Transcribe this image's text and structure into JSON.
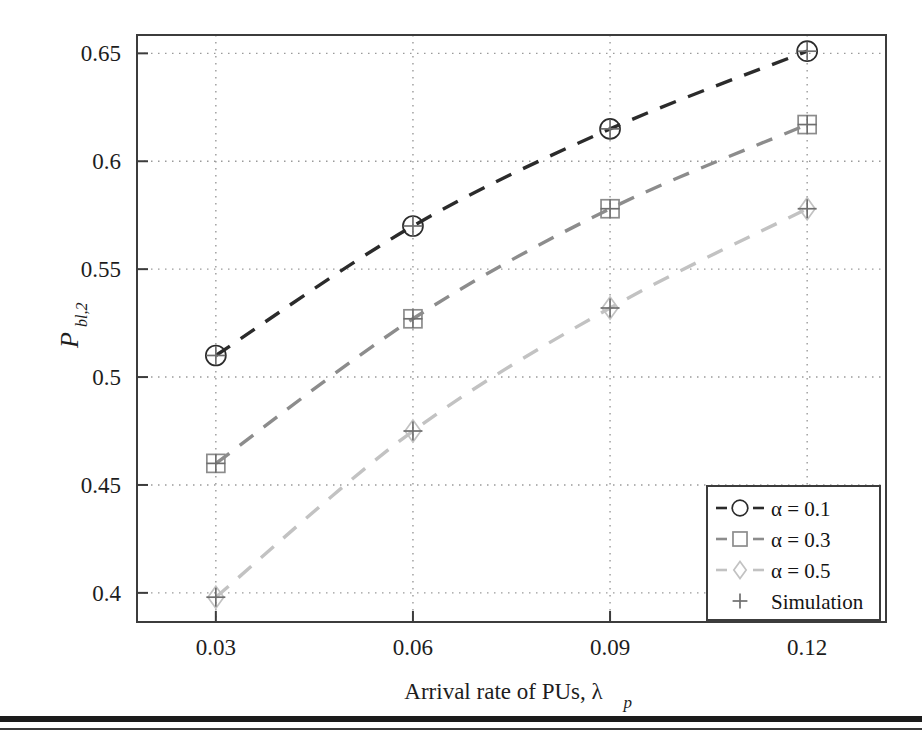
{
  "chart_data": {
    "type": "line",
    "title": "",
    "xlabel": "Arrival rate of PUs, λ",
    "xlabel_sub": "p",
    "ylabel": "P",
    "ylabel_sub": "bl,2",
    "x": [
      0.03,
      0.06,
      0.09,
      0.12
    ],
    "xtick_labels": [
      "0.03",
      "0.06",
      "0.09",
      "0.12"
    ],
    "ytick_labels": [
      "0.4",
      "0.45",
      "0.5",
      "0.55",
      "0.6",
      "0.65"
    ],
    "ytick_values": [
      0.4,
      0.45,
      0.5,
      0.55,
      0.6,
      0.65
    ],
    "xlim": [
      0.018,
      0.132
    ],
    "ylim": [
      0.3865,
      0.6585
    ],
    "grid": true,
    "grid_style": "dotted",
    "legend_position": "bottom-right",
    "series": [
      {
        "name": "α = 0.1",
        "alpha": 0.1,
        "marker": "circle",
        "color": "#2b2b2b",
        "linestyle": "dashed",
        "values": [
          0.51,
          0.57,
          0.615,
          0.651
        ]
      },
      {
        "name": "α = 0.3",
        "alpha": 0.3,
        "marker": "square",
        "color": "#8c8c8c",
        "linestyle": "dashed",
        "values": [
          0.46,
          0.527,
          0.578,
          0.617
        ]
      },
      {
        "name": "α = 0.5",
        "alpha": 0.5,
        "marker": "diamond",
        "color": "#c2c2c2",
        "linestyle": "dashed",
        "values": [
          0.398,
          0.475,
          0.532,
          0.578
        ]
      },
      {
        "name": "Simulation",
        "marker": "plus",
        "color": "#6e6e6e",
        "linestyle": "none",
        "values": [
          0.51,
          0.57,
          0.615,
          0.651
        ]
      }
    ],
    "simulation_points": [
      {
        "x": 0.03,
        "y": 0.51
      },
      {
        "x": 0.06,
        "y": 0.57
      },
      {
        "x": 0.09,
        "y": 0.615
      },
      {
        "x": 0.12,
        "y": 0.651
      },
      {
        "x": 0.03,
        "y": 0.46
      },
      {
        "x": 0.06,
        "y": 0.527
      },
      {
        "x": 0.09,
        "y": 0.578
      },
      {
        "x": 0.12,
        "y": 0.617
      },
      {
        "x": 0.03,
        "y": 0.398
      },
      {
        "x": 0.06,
        "y": 0.475
      },
      {
        "x": 0.09,
        "y": 0.532
      },
      {
        "x": 0.12,
        "y": 0.578
      }
    ],
    "legend_entries": [
      {
        "label": "α = 0.1",
        "marker": "circle",
        "color": "#2b2b2b",
        "dashed": true
      },
      {
        "label": "α = 0.3",
        "marker": "square",
        "color": "#8c8c8c",
        "dashed": true
      },
      {
        "label": "α = 0.5",
        "marker": "diamond",
        "color": "#c2c2c2",
        "dashed": true
      },
      {
        "label": "Simulation",
        "marker": "plus",
        "color": "#6e6e6e",
        "dashed": false
      }
    ]
  },
  "colors": {
    "axis": "#3c3c3c",
    "grid": "#9a9a9a",
    "background": "#ffffff",
    "series_1": "#2b2b2b",
    "series_2": "#8c8c8c",
    "series_3": "#c2c2c2",
    "simulation": "#6e6e6e"
  }
}
